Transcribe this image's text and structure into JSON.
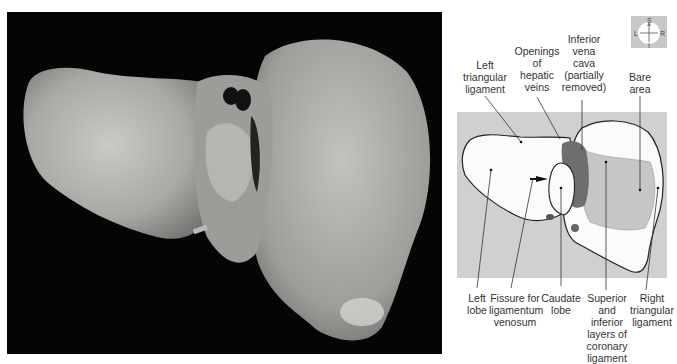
{
  "figure": {
    "photo": {
      "description": "Posterior view of liver specimen",
      "background": "#050505",
      "organ_color": "#a9a9a6"
    },
    "compass": {
      "superior": "S",
      "inferior": "I",
      "left": "L",
      "right": "R"
    },
    "diagram": {
      "background": "#d0d0d0",
      "liver_fill": "#fbfbfb",
      "bare_area_fill": "#c6c6c6",
      "ivc_fill": "#6e6e6e",
      "outline": "#222222"
    },
    "labels": {
      "top": [
        {
          "id": "left-triangular-ligament",
          "text": "Left\ntriangular\nligament"
        },
        {
          "id": "openings-of-hepatic-veins",
          "text": "Openings\nof\nhepatic\nveins"
        },
        {
          "id": "inferior-vena-cava",
          "text": "Inferior\nvena\ncava\n(partially\nremoved)"
        },
        {
          "id": "bare-area",
          "text": "Bare\narea"
        }
      ],
      "bottom": [
        {
          "id": "left-lobe",
          "text": "Left\nlobe"
        },
        {
          "id": "fissure-for-ligamentum-venosum",
          "text": "Fissure for\nligamentum\nvenosum"
        },
        {
          "id": "caudate-lobe",
          "text": "Caudate\nlobe"
        },
        {
          "id": "coronary-ligament-layers",
          "text": "Superior\nand inferior\nlayers of\ncoronary\nligament"
        },
        {
          "id": "right-triangular-ligament",
          "text": "Right\ntriangular\nligament"
        }
      ]
    }
  }
}
